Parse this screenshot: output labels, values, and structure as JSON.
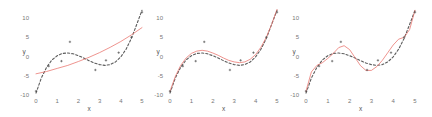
{
  "chart_data": [
    {
      "type": "line",
      "title": "",
      "xlabel": "x",
      "ylabel": "y",
      "xlim": [
        0,
        5
      ],
      "ylim": [
        -10,
        12
      ],
      "xticks": [
        0,
        1,
        2,
        3,
        4,
        5
      ],
      "yticks": [
        -10,
        -5,
        0,
        5,
        10
      ],
      "grid": false,
      "legend": "none",
      "scatter_points": {
        "x": [
          0.0,
          0.6,
          1.2,
          1.6,
          2.8,
          3.3,
          3.9,
          4.5,
          5.0
        ],
        "y": [
          -9.0,
          -2.5,
          -1.2,
          3.8,
          -3.5,
          -1.0,
          1.0,
          5.0,
          11.5
        ]
      },
      "series": [
        {
          "name": "true function",
          "style": "dashed",
          "color": "#333333",
          "x": [
            0,
            0.25,
            0.5,
            0.75,
            1.0,
            1.25,
            1.5,
            1.75,
            2.0,
            2.25,
            2.5,
            2.75,
            3.0,
            3.25,
            3.5,
            3.75,
            4.0,
            4.25,
            4.5,
            4.75,
            5.0
          ],
          "y": [
            -9.5,
            -5.6,
            -2.8,
            -0.9,
            0.2,
            0.8,
            0.9,
            0.7,
            0.2,
            -0.4,
            -1.1,
            -1.7,
            -2.1,
            -2.3,
            -2.1,
            -1.4,
            -0.1,
            1.9,
            4.7,
            8.3,
            12.0
          ]
        },
        {
          "name": "fit (degree 2)",
          "style": "solid",
          "color": "#e8736c",
          "x": [
            0,
            0.5,
            1.0,
            1.5,
            2.0,
            2.5,
            3.0,
            3.5,
            4.0,
            4.5,
            5.0
          ],
          "y": [
            -4.5,
            -3.9,
            -3.1,
            -2.3,
            -1.3,
            -0.2,
            1.0,
            2.4,
            3.9,
            5.6,
            7.5
          ]
        }
      ]
    },
    {
      "type": "line",
      "title": "",
      "xlabel": "x",
      "ylabel": "y",
      "xlim": [
        0,
        5
      ],
      "ylim": [
        -10,
        12
      ],
      "xticks": [
        0,
        1,
        2,
        3,
        4,
        5
      ],
      "yticks": [
        -10,
        -5,
        0,
        5,
        10
      ],
      "grid": false,
      "legend": "none",
      "scatter_points": {
        "x": [
          0.0,
          0.6,
          1.2,
          1.6,
          2.8,
          3.3,
          3.9,
          4.5,
          5.0
        ],
        "y": [
          -9.0,
          -2.5,
          -1.2,
          3.8,
          -3.5,
          -1.0,
          1.0,
          5.0,
          11.5
        ]
      },
      "series": [
        {
          "name": "true function",
          "style": "dashed",
          "color": "#333333",
          "x": [
            0,
            0.25,
            0.5,
            0.75,
            1.0,
            1.25,
            1.5,
            1.75,
            2.0,
            2.25,
            2.5,
            2.75,
            3.0,
            3.25,
            3.5,
            3.75,
            4.0,
            4.25,
            4.5,
            4.75,
            5.0
          ],
          "y": [
            -9.5,
            -5.6,
            -2.8,
            -0.9,
            0.2,
            0.8,
            0.9,
            0.7,
            0.2,
            -0.4,
            -1.1,
            -1.7,
            -2.1,
            -2.3,
            -2.1,
            -1.4,
            -0.1,
            1.9,
            4.7,
            8.3,
            12.0
          ]
        },
        {
          "name": "fit (degree 3)",
          "style": "solid",
          "color": "#e8736c",
          "x": [
            0,
            0.25,
            0.5,
            0.75,
            1.0,
            1.25,
            1.5,
            1.75,
            2.0,
            2.25,
            2.5,
            2.75,
            3.0,
            3.25,
            3.5,
            3.75,
            4.0,
            4.25,
            4.5,
            4.75,
            5.0
          ],
          "y": [
            -9.0,
            -5.2,
            -2.3,
            -0.4,
            0.8,
            1.4,
            1.6,
            1.4,
            0.9,
            0.3,
            -0.4,
            -1.0,
            -1.4,
            -1.6,
            -1.4,
            -0.7,
            0.5,
            2.4,
            5.0,
            8.3,
            12.2
          ]
        }
      ]
    },
    {
      "type": "line",
      "title": "",
      "xlabel": "x",
      "ylabel": "y",
      "xlim": [
        0,
        5
      ],
      "ylim": [
        -10,
        12
      ],
      "xticks": [
        0,
        1,
        2,
        3,
        4,
        5
      ],
      "yticks": [
        -10,
        -5,
        0,
        5,
        10
      ],
      "grid": false,
      "legend": "none",
      "scatter_points": {
        "x": [
          0.0,
          0.6,
          1.2,
          1.6,
          2.8,
          3.3,
          3.9,
          4.5,
          5.0
        ],
        "y": [
          -9.0,
          -2.5,
          -1.2,
          3.8,
          -3.5,
          -1.0,
          1.0,
          5.0,
          11.5
        ]
      },
      "series": [
        {
          "name": "true function",
          "style": "dashed",
          "color": "#333333",
          "x": [
            0,
            0.25,
            0.5,
            0.75,
            1.0,
            1.25,
            1.5,
            1.75,
            2.0,
            2.25,
            2.5,
            2.75,
            3.0,
            3.25,
            3.5,
            3.75,
            4.0,
            4.25,
            4.5,
            4.75,
            5.0
          ],
          "y": [
            -9.5,
            -5.6,
            -2.8,
            -0.9,
            0.2,
            0.8,
            0.9,
            0.7,
            0.2,
            -0.4,
            -1.1,
            -1.7,
            -2.1,
            -2.3,
            -2.1,
            -1.4,
            -0.1,
            1.9,
            4.7,
            8.3,
            12.0
          ]
        },
        {
          "name": "fit (high degree)",
          "style": "solid",
          "color": "#e8736c",
          "x": [
            0,
            0.25,
            0.5,
            0.75,
            1.0,
            1.25,
            1.5,
            1.75,
            2.0,
            2.25,
            2.5,
            2.75,
            3.0,
            3.25,
            3.5,
            3.75,
            4.0,
            4.25,
            4.5,
            4.75,
            5.0
          ],
          "y": [
            -9.0,
            -4.0,
            -2.3,
            -1.6,
            -0.5,
            0.8,
            2.3,
            2.8,
            1.8,
            -0.3,
            -2.4,
            -3.6,
            -3.6,
            -2.6,
            -1.0,
            1.0,
            3.0,
            4.5,
            5.0,
            7.0,
            12.0
          ]
        }
      ]
    }
  ],
  "panels": [
    {
      "xlabel": "x",
      "ylabel": "y"
    },
    {
      "xlabel": "x",
      "ylabel": "y"
    },
    {
      "xlabel": "x",
      "ylabel": "y"
    }
  ]
}
